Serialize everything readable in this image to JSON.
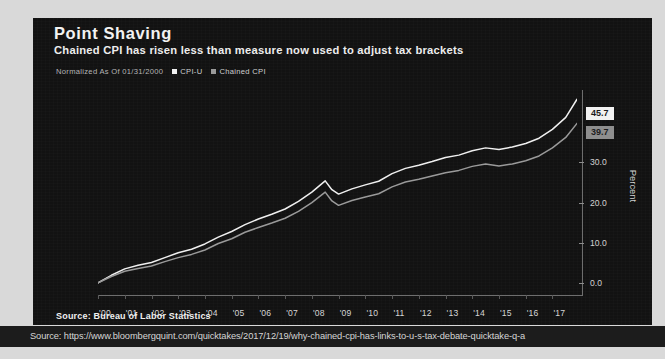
{
  "header": {
    "title": "Point Shaving",
    "subtitle": "Chained CPI has risen less than measure now used to adjust tax brackets"
  },
  "legend": {
    "normalized_note": "Normalized As Of 01/31/2000",
    "entries": [
      {
        "label": "CPI-U",
        "color": "#f0f0f0"
      },
      {
        "label": "Chained CPI",
        "color": "#9a9a9a"
      }
    ]
  },
  "value_badges": [
    {
      "name": "cpi-u",
      "value": "45.7",
      "bg": "#f2f2f2",
      "fg": "#1b1b1b"
    },
    {
      "name": "chained-cpi",
      "value": "39.7",
      "bg": "#8e8e8e",
      "fg": "#1d1d1d"
    }
  ],
  "axis": {
    "y_title": "Percent",
    "y_ticks": [
      "0.0",
      "10.0",
      "20.0",
      "30.0"
    ],
    "x_ticks": [
      "'00",
      "'01",
      "'02",
      "'03",
      "'04",
      "'05",
      "'06",
      "'07",
      "'08",
      "'09",
      "'10",
      "'11",
      "'12",
      "'13",
      "'14",
      "'15",
      "'16",
      "'17"
    ]
  },
  "footer": {
    "source": "Source: Bureau of Labor Statistics",
    "url": "Source: https://www.bloombergquint.com/quicktakes/2017/12/19/why-chained-cpi-has-links-to-u-s-tax-debate-quicktake-q-a"
  },
  "chart_data": {
    "type": "line",
    "title": "Point Shaving",
    "subtitle": "Chained CPI has risen less than measure now used to adjust tax brackets",
    "xlabel": "",
    "ylabel": "Percent",
    "ylim": [
      -3.0,
      48.0
    ],
    "xlim": [
      2000.0,
      2017.92
    ],
    "grid": false,
    "legend_position": "top-left",
    "note": "Normalized As Of 01/31/2000",
    "x": [
      2000.0,
      2000.5,
      2001.0,
      2001.5,
      2002.0,
      2002.5,
      2003.0,
      2003.5,
      2004.0,
      2004.5,
      2005.0,
      2005.5,
      2006.0,
      2006.5,
      2007.0,
      2007.5,
      2008.0,
      2008.5,
      2008.75,
      2009.0,
      2009.5,
      2010.0,
      2010.5,
      2011.0,
      2011.5,
      2012.0,
      2012.5,
      2013.0,
      2013.5,
      2014.0,
      2014.5,
      2015.0,
      2015.5,
      2016.0,
      2016.5,
      2017.0,
      2017.5,
      2017.92
    ],
    "series": [
      {
        "name": "CPI-U",
        "color": "#f0f0f0",
        "values": [
          0.0,
          1.9,
          3.5,
          4.4,
          5.1,
          6.3,
          7.5,
          8.4,
          9.7,
          11.4,
          12.8,
          14.5,
          15.9,
          17.1,
          18.4,
          20.3,
          22.6,
          25.4,
          23.2,
          22.1,
          23.4,
          24.4,
          25.3,
          27.2,
          28.5,
          29.3,
          30.2,
          31.2,
          31.8,
          32.9,
          33.6,
          33.2,
          33.8,
          34.7,
          36.0,
          38.2,
          41.2,
          45.7
        ],
        "end_label": "45.7"
      },
      {
        "name": "Chained CPI",
        "color": "#9a9a9a",
        "values": [
          0.0,
          1.6,
          2.9,
          3.6,
          4.2,
          5.3,
          6.3,
          7.1,
          8.2,
          9.8,
          11.0,
          12.6,
          13.8,
          14.9,
          16.1,
          17.8,
          20.0,
          22.6,
          20.4,
          19.3,
          20.5,
          21.4,
          22.2,
          23.9,
          25.1,
          25.8,
          26.6,
          27.4,
          28.0,
          29.0,
          29.6,
          29.1,
          29.6,
          30.4,
          31.6,
          33.6,
          36.2,
          39.7
        ],
        "end_label": "39.7"
      }
    ]
  }
}
